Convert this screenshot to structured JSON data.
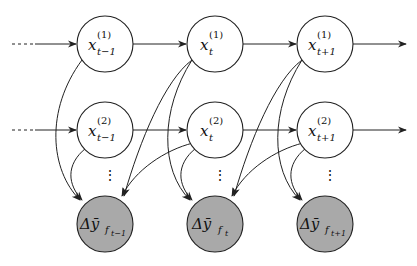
{
  "diagram": {
    "type": "graphical-model",
    "row1": [
      {
        "base": "x",
        "sup": "(1)",
        "sub": "t−1"
      },
      {
        "base": "x",
        "sup": "(1)",
        "sub": "t"
      },
      {
        "base": "x",
        "sup": "(1)",
        "sub": "t+1"
      }
    ],
    "row2": [
      {
        "base": "x",
        "sup": "(2)",
        "sub": "t−1"
      },
      {
        "base": "x",
        "sup": "(2)",
        "sub": "t"
      },
      {
        "base": "x",
        "sup": "(2)",
        "sub": "t+1"
      }
    ],
    "observed": [
      {
        "base": "Δȳ",
        "sub": "f",
        "subsub": "t−1"
      },
      {
        "base": "Δȳ",
        "sub": "f",
        "subsub": "t"
      },
      {
        "base": "Δȳ",
        "sub": "f",
        "subsub": "t+1"
      }
    ],
    "vdots": "⋮",
    "colors": {
      "observed_fill": "#a9a9a9",
      "node_fill": "#ffffff",
      "stroke": "#222222"
    }
  }
}
